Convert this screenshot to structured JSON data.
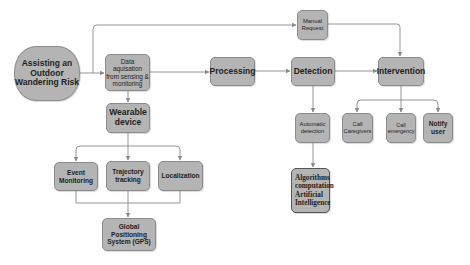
{
  "diagram": {
    "title": "Assisting an Outdoor Wandering Risk",
    "colors": {
      "node_fill": "#b4b4b4",
      "node_border": "#8c8c8c",
      "edge": "#8a8a8a",
      "background": "#ffffff"
    },
    "nodes": {
      "start": {
        "label": "Assisting an\nOutdoor\nWandering Risk"
      },
      "data_acquisition": {
        "label": "Data\naquisation\nfrom sensing &\nmonitoring"
      },
      "wearable": {
        "label": "Wearable\ndevice"
      },
      "processing": {
        "label": "Processing"
      },
      "detection": {
        "label": "Detection"
      },
      "manual_request": {
        "label": "Manual\nRequest"
      },
      "intervention": {
        "label": "Intervention"
      },
      "automatic_detection": {
        "label": "Automatic\ndetection"
      },
      "algorithms": {
        "label": "Algorithms\ncomputation\nArtificial\nIntelligence"
      },
      "call_caregivers": {
        "label": "Call\nCaregivers"
      },
      "call_emergency": {
        "label": "Call\nemergency"
      },
      "notify_user": {
        "label": "Notify\nuser"
      },
      "event_monitoring": {
        "label": "Event\nMonitoring"
      },
      "trajectory_tracking": {
        "label": "Trajectory\ntracking"
      },
      "localization": {
        "label": "Localization"
      },
      "gps": {
        "label": "Global\nPositioning\nSystem (GPS)"
      }
    },
    "edges": [
      [
        "start",
        "data_acquisition"
      ],
      [
        "start",
        "manual_request"
      ],
      [
        "data_acquisition",
        "processing"
      ],
      [
        "data_acquisition",
        "wearable"
      ],
      [
        "processing",
        "detection"
      ],
      [
        "detection",
        "intervention"
      ],
      [
        "manual_request",
        "intervention"
      ],
      [
        "detection",
        "automatic_detection"
      ],
      [
        "automatic_detection",
        "algorithms"
      ],
      [
        "intervention",
        "call_caregivers"
      ],
      [
        "intervention",
        "call_emergency"
      ],
      [
        "intervention",
        "notify_user"
      ],
      [
        "wearable",
        "event_monitoring"
      ],
      [
        "wearable",
        "trajectory_tracking"
      ],
      [
        "wearable",
        "localization"
      ],
      [
        "event_monitoring",
        "gps"
      ],
      [
        "trajectory_tracking",
        "gps"
      ],
      [
        "localization",
        "gps"
      ]
    ]
  }
}
